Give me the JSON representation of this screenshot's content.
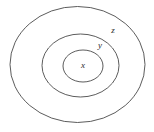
{
  "diagram": {
    "background_color": "#ffffff",
    "stroke_color": "#4a4a4a",
    "label_color": "#2b2b2b",
    "canvas": {
      "width": 154,
      "height": 132
    },
    "ellipses": [
      {
        "name": "outer-ellipse",
        "label": "z",
        "cx": 77.5,
        "cy": 64.5,
        "rx": 67.5,
        "ry": 58.0,
        "stroke_width": 0.9
      },
      {
        "name": "middle-ellipse",
        "label": "y",
        "cx": 80.5,
        "cy": 65.5,
        "rx": 38.5,
        "ry": 31.5,
        "stroke_width": 0.9
      },
      {
        "name": "inner-ellipse",
        "label": "x",
        "cx": 83.0,
        "cy": 66.0,
        "rx": 20.0,
        "ry": 16.0,
        "stroke_width": 0.9
      }
    ],
    "labels": [
      {
        "name": "label-z",
        "text": "z",
        "x": 113,
        "y": 31,
        "font_size": 9
      },
      {
        "name": "label-y",
        "text": "y",
        "x": 100,
        "y": 46,
        "font_size": 9
      },
      {
        "name": "label-x",
        "text": "x",
        "x": 83,
        "y": 66,
        "font_size": 9
      }
    ]
  }
}
